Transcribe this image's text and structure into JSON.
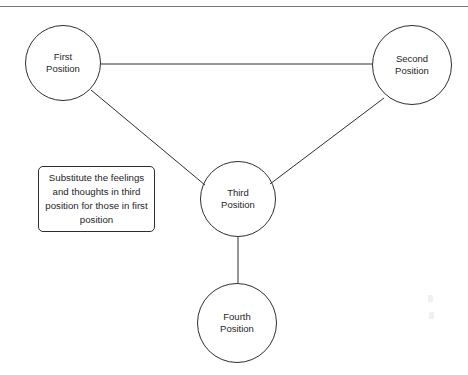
{
  "diagram": {
    "background_color": "#ffffff",
    "line_color": "#2e2e2e",
    "text_color": "#262626",
    "rule_color": "#7a7a80",
    "nodes": [
      {
        "id": "first",
        "line1": "First",
        "line2": "Position",
        "cx": 63,
        "cy": 63,
        "r": 38
      },
      {
        "id": "second",
        "line1": "Second",
        "line2": "Position",
        "cx": 412,
        "cy": 65,
        "r": 40
      },
      {
        "id": "third",
        "line1": "Third",
        "line2": "Position",
        "cx": 238,
        "cy": 199,
        "r": 38
      },
      {
        "id": "fourth",
        "line1": "Fourth",
        "line2": "Position",
        "cx": 237,
        "cy": 323,
        "r": 40
      }
    ],
    "edges": [
      {
        "id": "first-to-second",
        "x1": 101,
        "y1": 64,
        "x2": 372,
        "y2": 64
      },
      {
        "id": "first-to-third",
        "x1": 91,
        "y1": 90,
        "x2": 205,
        "y2": 185
      },
      {
        "id": "second-to-third",
        "x1": 384,
        "y1": 98,
        "x2": 270,
        "y2": 184
      },
      {
        "id": "third-to-fourth",
        "x1": 238,
        "y1": 237,
        "x2": 238,
        "y2": 283
      }
    ],
    "callout": {
      "id": "substitute-note",
      "text": "Substitute the feelings and thoughts in third position for those in first position",
      "x": 38,
      "y": 166,
      "width": 117,
      "height": 66
    }
  }
}
